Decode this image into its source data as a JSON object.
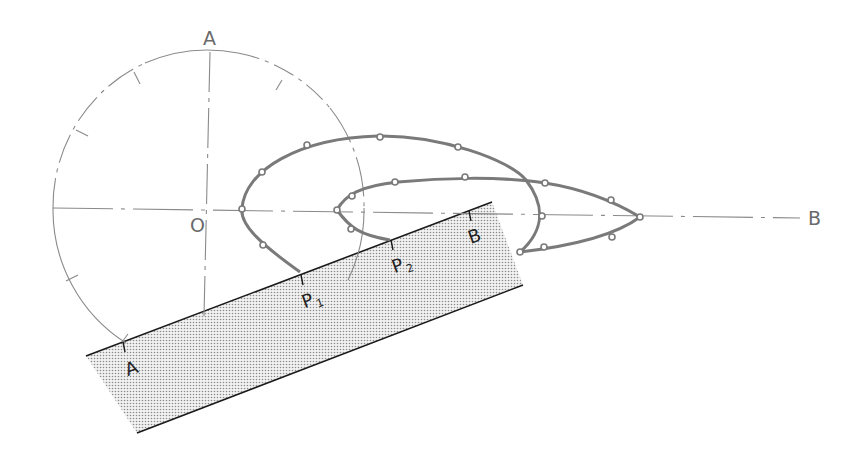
{
  "diagram": {
    "type": "technical-drawing",
    "colors": {
      "background": "#ffffff",
      "construction_line": "#8a8a8a",
      "curve": "#7a7a7a",
      "band_edge": "#1a1a1a",
      "band_fill": "#c8c8c8"
    },
    "labels": {
      "top_axis": "A",
      "origin": "O",
      "right_axis": "B",
      "band_left": "A",
      "band_p1": "P",
      "band_p1_sub": "1",
      "band_p2": "P",
      "band_p2_sub": "2",
      "band_right": "B"
    },
    "circle": {
      "center": [
        207,
        208
      ],
      "radius": 158
    },
    "band": {
      "top_left": [
        86,
        356
      ],
      "top_right": [
        492,
        202
      ],
      "bottom_right": [
        523,
        285
      ],
      "bottom_left": [
        137,
        433
      ]
    }
  }
}
